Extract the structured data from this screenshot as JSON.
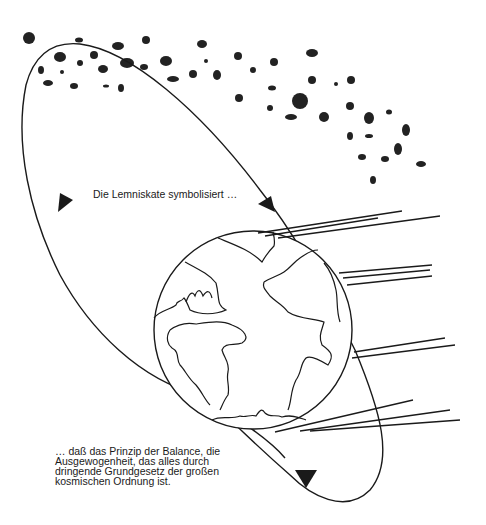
{
  "colors": {
    "ink": "#1a1a1a",
    "dot": "#222222",
    "background": "#ffffff"
  },
  "captions": {
    "top": "Die Lemniskate symbolisiert …",
    "bottom": [
      "… daß das Prinzip der Balance, die",
      "Ausgewogenheit, das alles durch",
      "dringende Grundgesetz der großen",
      "kosmischen Ordnung ist."
    ]
  },
  "icons": {
    "earth": "globe-icon",
    "arrows": [
      "arrowhead-up-left",
      "arrowhead-down-right",
      "arrowhead-bottom"
    ]
  },
  "dots": [
    [
      29,
      38,
      6,
      6
    ],
    [
      79,
      40,
      4,
      2.5
    ],
    [
      118,
      46,
      6,
      4
    ],
    [
      146,
      40,
      4,
      4
    ],
    [
      202,
      44,
      5,
      4
    ],
    [
      60,
      57,
      6,
      5
    ],
    [
      80,
      63,
      3,
      3
    ],
    [
      94,
      55,
      4,
      4
    ],
    [
      127,
      63,
      7,
      5
    ],
    [
      144,
      67,
      4,
      3
    ],
    [
      166,
      61,
      6,
      5
    ],
    [
      41,
      70,
      3,
      4
    ],
    [
      62,
      72,
      2,
      2
    ],
    [
      103,
      69,
      5,
      4
    ],
    [
      193,
      74,
      4,
      4
    ],
    [
      173,
      79,
      6,
      3
    ],
    [
      206,
      61,
      2,
      2
    ],
    [
      217,
      75,
      4,
      5
    ],
    [
      48,
      83,
      5,
      3
    ],
    [
      74,
      86,
      4,
      3
    ],
    [
      106,
      86,
      3,
      1.5
    ],
    [
      121,
      88,
      3,
      4
    ],
    [
      238,
      56,
      4,
      4
    ],
    [
      253,
      70,
      3,
      3
    ],
    [
      274,
      62,
      4,
      4
    ],
    [
      312,
      53,
      6,
      4
    ],
    [
      312,
      80,
      4,
      4
    ],
    [
      239,
      98,
      4,
      4
    ],
    [
      272,
      88,
      4,
      2.5
    ],
    [
      300,
      101,
      8,
      8
    ],
    [
      270,
      108,
      3,
      3
    ],
    [
      291,
      117,
      6,
      3
    ],
    [
      324,
      117,
      5,
      5
    ],
    [
      336,
      84,
      2,
      2
    ],
    [
      351,
      80,
      4,
      4
    ],
    [
      350,
      106,
      4,
      4
    ],
    [
      369,
      118,
      5,
      6
    ],
    [
      350,
      136,
      3,
      4
    ],
    [
      369,
      136,
      4,
      2
    ],
    [
      389,
      112,
      3,
      2.5
    ],
    [
      406,
      130,
      4,
      6
    ],
    [
      398,
      149,
      4,
      6
    ],
    [
      362,
      157,
      4,
      3
    ],
    [
      385,
      159,
      4,
      3
    ],
    [
      421,
      164,
      5,
      3
    ],
    [
      373,
      180,
      3,
      4
    ]
  ],
  "earth": {
    "cx": 253,
    "cy": 330,
    "r": 99
  },
  "speed_lines": [
    [
      258,
      233,
      402,
      211
    ],
    [
      265,
      236,
      378,
      218
    ],
    [
      278,
      238,
      440,
      216
    ],
    [
      339,
      273,
      432,
      265
    ],
    [
      343,
      278,
      430,
      270
    ],
    [
      347,
      285,
      432,
      276
    ],
    [
      354,
      352,
      445,
      338
    ],
    [
      352,
      358,
      455,
      345
    ],
    [
      275,
      432,
      413,
      400
    ],
    [
      300,
      431,
      450,
      410
    ],
    [
      310,
      431,
      460,
      420
    ]
  ]
}
